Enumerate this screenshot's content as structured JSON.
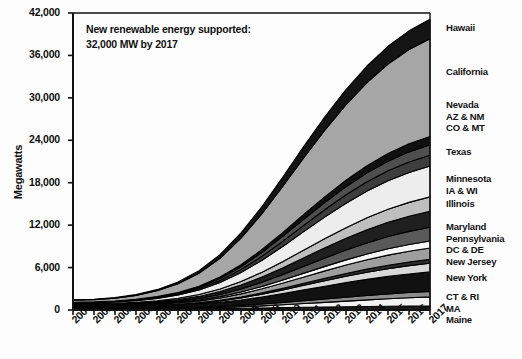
{
  "chart_data": {
    "type": "area",
    "title": "",
    "annotation": "New renewable energy supported:\n32,000 MW by 2017",
    "xlabel": "",
    "ylabel": "Megawatts",
    "ylim": [
      0,
      42000
    ],
    "yticks": [
      "0",
      "6,000",
      "12,000",
      "18,000",
      "24,000",
      "30,000",
      "36,000",
      "42,000"
    ],
    "ytick_values": [
      0,
      6000,
      12000,
      18000,
      24000,
      30000,
      36000,
      42000
    ],
    "grid": false,
    "stacked": true,
    "legend_position": "right",
    "x": [
      2000,
      2001,
      2002,
      2003,
      2004,
      2005,
      2006,
      2007,
      2008,
      2009,
      2010,
      2011,
      2012,
      2013,
      2014,
      2015,
      2016,
      2017
    ],
    "categories": [
      "2000",
      "2001",
      "2002",
      "2003",
      "2004",
      "2005",
      "2006",
      "2007",
      "2008",
      "2009",
      "2010",
      "2011",
      "2012",
      "2013",
      "2014",
      "2015",
      "2016",
      "2017"
    ],
    "series": [
      {
        "name": "Maine",
        "color": "#1a1a1a",
        "values": [
          120,
          120,
          120,
          130,
          140,
          150,
          170,
          200,
          240,
          290,
          340,
          390,
          430,
          470,
          500,
          530,
          550,
          570
        ]
      },
      {
        "name": "MA",
        "color": "#f2f2f2",
        "values": [
          60,
          60,
          65,
          70,
          80,
          95,
          120,
          160,
          220,
          300,
          400,
          520,
          650,
          790,
          930,
          1060,
          1180,
          1280
        ]
      },
      {
        "name": "CT & RI",
        "color": "#8c8c8c",
        "values": [
          70,
          70,
          75,
          80,
          90,
          105,
          125,
          155,
          200,
          255,
          320,
          395,
          470,
          545,
          615,
          680,
          740,
          790
        ]
      },
      {
        "name": "New York",
        "color": "#111111",
        "values": [
          180,
          185,
          195,
          215,
          250,
          310,
          410,
          560,
          760,
          1000,
          1270,
          1550,
          1820,
          2070,
          2290,
          2480,
          2630,
          2750
        ]
      },
      {
        "name": "New Jersey",
        "color": "#d9d9d9",
        "values": [
          40,
          42,
          48,
          58,
          75,
          100,
          140,
          200,
          285,
          390,
          510,
          640,
          770,
          890,
          1000,
          1095,
          1170,
          1230
        ]
      },
      {
        "name": "DC & DE",
        "color": "#2b2b2b",
        "values": [
          30,
          30,
          33,
          38,
          46,
          58,
          76,
          102,
          138,
          182,
          232,
          286,
          340,
          392,
          440,
          482,
          518,
          548
        ]
      },
      {
        "name": "Pennsylvania",
        "color": "#9e9e9e",
        "values": [
          90,
          92,
          100,
          115,
          140,
          180,
          240,
          325,
          440,
          580,
          735,
          895,
          1050,
          1195,
          1325,
          1435,
          1525,
          1595
        ]
      },
      {
        "name": "Maryland",
        "color": "#f7f7f7",
        "values": [
          50,
          52,
          57,
          66,
          82,
          105,
          140,
          190,
          258,
          342,
          438,
          540,
          640,
          735,
          820,
          892,
          950,
          995
        ]
      },
      {
        "name": "Illinois",
        "color": "#595959",
        "values": [
          60,
          62,
          70,
          85,
          110,
          150,
          210,
          300,
          425,
          585,
          775,
          985,
          1195,
          1395,
          1575,
          1730,
          1855,
          1950
        ]
      },
      {
        "name": "IA & WI",
        "color": "#1f1f1f",
        "values": [
          80,
          85,
          98,
          120,
          155,
          210,
          290,
          405,
          560,
          750,
          970,
          1205,
          1440,
          1660,
          1855,
          2020,
          2150,
          2250
        ]
      },
      {
        "name": "Minnesota",
        "color": "#bfbfbf",
        "values": [
          70,
          75,
          88,
          108,
          140,
          190,
          262,
          366,
          505,
          678,
          878,
          1092,
          1305,
          1505,
          1682,
          1832,
          1952,
          2042
        ]
      },
      {
        "name": "Texas",
        "color": "#ededed",
        "values": [
          150,
          160,
          190,
          245,
          330,
          460,
          650,
          920,
          1270,
          1690,
          2150,
          2620,
          3060,
          3450,
          3780,
          4040,
          4230,
          4360
        ]
      },
      {
        "name": "CO & MT",
        "color": "#3d3d3d",
        "values": [
          40,
          44,
          54,
          72,
          100,
          142,
          205,
          295,
          415,
          562,
          725,
          892,
          1050,
          1192,
          1312,
          1408,
          1480,
          1530
        ]
      },
      {
        "name": "AZ & NM",
        "color": "#4f4f4f",
        "values": [
          35,
          38,
          47,
          63,
          90,
          130,
          190,
          276,
          392,
          535,
          695,
          858,
          1012,
          1150,
          1268,
          1362,
          1432,
          1480
        ]
      },
      {
        "name": "Nevada",
        "color": "#111111",
        "values": [
          25,
          27,
          34,
          46,
          66,
          97,
          143,
          209,
          299,
          411,
          538,
          668,
          792,
          904,
          1000,
          1078,
          1136,
          1176
        ]
      },
      {
        "name": "California",
        "color": "#a6a6a6",
        "values": [
          300,
          320,
          400,
          560,
          820,
          1220,
          1820,
          2650,
          3750,
          5080,
          6560,
          8050,
          9450,
          10700,
          11780,
          12660,
          13340,
          13820
        ]
      },
      {
        "name": "Hawaii",
        "color": "#141414",
        "values": [
          60,
          64,
          80,
          112,
          164,
          244,
          362,
          526,
          744,
          1006,
          1298,
          1592,
          1868,
          2116,
          2330,
          2506,
          2642,
          2740
        ]
      }
    ],
    "total_2017": 41106,
    "legend_groups": [
      {
        "id": "hawaii",
        "top": 22,
        "lines": [
          "Hawaii"
        ]
      },
      {
        "id": "california",
        "top": 66,
        "lines": [
          "California"
        ]
      },
      {
        "id": "nevada-az-co",
        "top": 99,
        "lines": [
          "Nevada",
          "AZ & NM",
          "CO & MT"
        ]
      },
      {
        "id": "texas",
        "top": 146,
        "lines": [
          "Texas"
        ]
      },
      {
        "id": "minnesota-ia-wi",
        "top": 173,
        "lines": [
          "Minnesota",
          "IA & WI"
        ]
      },
      {
        "id": "illinois",
        "top": 198,
        "lines": [
          "Illinois"
        ]
      },
      {
        "id": "maryland-pa-dc-nj",
        "top": 221,
        "lines": [
          "Maryland",
          "Pennsylvania",
          "DC & DE",
          "New Jersey"
        ]
      },
      {
        "id": "new-york",
        "top": 272,
        "lines": [
          "New York"
        ]
      },
      {
        "id": "ct-ri-ma-maine",
        "top": 291,
        "lines": [
          "CT & RI",
          "MA",
          "Maine"
        ]
      }
    ]
  }
}
